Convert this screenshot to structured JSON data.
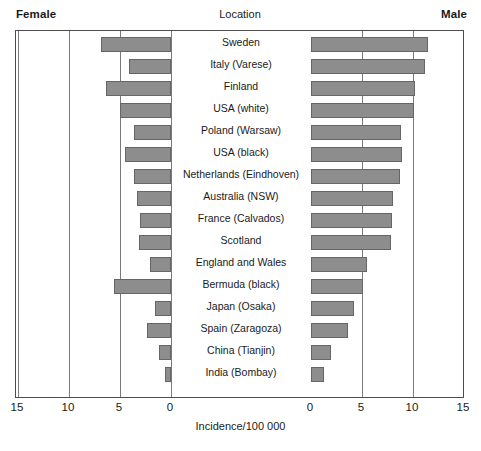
{
  "header": {
    "female_label": "Female",
    "male_label": "Male",
    "location_label": "Location"
  },
  "axis": {
    "title": "Incidence/100 000",
    "tick_labels": [
      "15",
      "10",
      "5",
      "0",
      "0",
      "5",
      "10",
      "15"
    ]
  },
  "footnote": "",
  "colors": {
    "bar_fill": "#8d8d8d",
    "bar_border": "#666666",
    "frame": "#4d4d4d",
    "gridline": "#7a7a7a"
  },
  "chart_data": {
    "type": "bar",
    "orientation": "horizontal-diverging",
    "title": "",
    "xlabel": "Incidence/100 000",
    "ylabel": "Location",
    "categories": [
      "Sweden",
      "Italy (Varese)",
      "Finland",
      "USA (white)",
      "Poland (Warsaw)",
      "USA (black)",
      "Netherlands (Eindhoven)",
      "Australia (NSW)",
      "France (Calvados)",
      "Scotland",
      "England and Wales",
      "Bermuda (black)",
      "Japan (Osaka)",
      "Spain (Zaragoza)",
      "China (Tianjin)",
      "India (Bombay)"
    ],
    "series": [
      {
        "name": "Female",
        "direction": "left",
        "values": [
          6.9,
          4.1,
          6.4,
          5.0,
          3.6,
          4.5,
          3.6,
          3.3,
          3.0,
          3.1,
          2.1,
          5.6,
          1.6,
          2.4,
          1.2,
          0.6
        ]
      },
      {
        "name": "Male",
        "direction": "right",
        "values": [
          11.5,
          11.2,
          10.2,
          10.1,
          8.8,
          8.9,
          8.7,
          8.0,
          7.9,
          7.8,
          5.5,
          5.1,
          4.2,
          3.6,
          2.0,
          1.3
        ]
      }
    ],
    "xlim_left": [
      15,
      0
    ],
    "xlim_right": [
      0,
      15
    ],
    "xticks_left": [
      15,
      10,
      5,
      0
    ],
    "xticks_right": [
      0,
      5,
      10,
      15
    ],
    "grid": true,
    "legend": "none"
  }
}
